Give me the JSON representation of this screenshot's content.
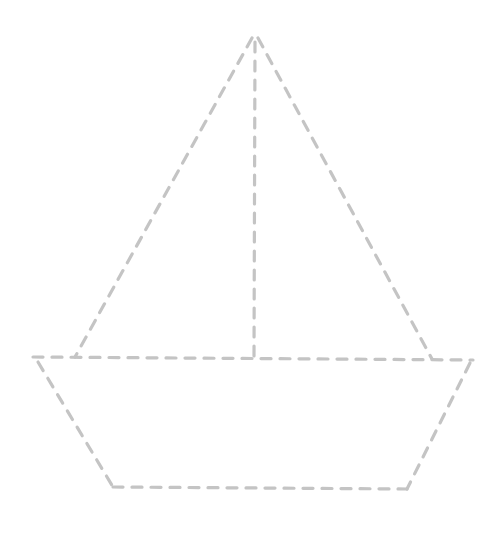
{
  "drawing": {
    "subject": "sailboat",
    "style": "dashed-outline tracing worksheet",
    "stroke_color": "#c4c4c4",
    "background": "#ffffff",
    "apex": [
      254,
      36
    ],
    "sail_left": {
      "from": [
        252,
        38
      ],
      "to": [
        75,
        357
      ]
    },
    "sail_right": {
      "from": [
        258,
        38
      ],
      "to": [
        432,
        359
      ]
    },
    "mast": {
      "from": [
        255,
        42
      ],
      "to": [
        254,
        357
      ]
    },
    "deck": {
      "from": [
        33,
        357
      ],
      "to": [
        473,
        360
      ]
    },
    "hull_left": {
      "from": [
        38,
        362
      ],
      "to": [
        113,
        487
      ]
    },
    "hull_bottom": {
      "from": [
        113,
        487
      ],
      "to": [
        407,
        489
      ]
    },
    "hull_right": {
      "from": [
        470,
        363
      ],
      "to": [
        407,
        489
      ]
    }
  }
}
